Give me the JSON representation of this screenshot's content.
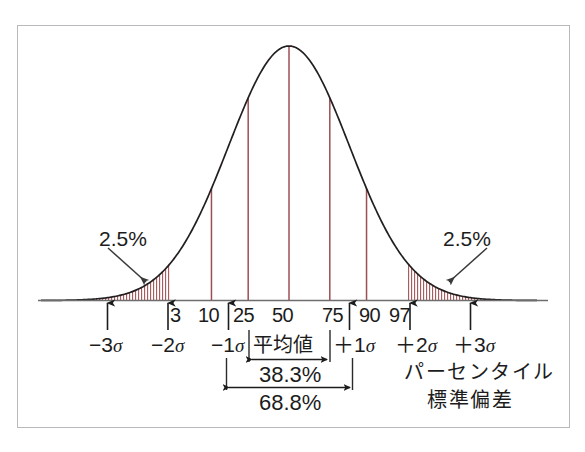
{
  "figure": {
    "kind": "normal-distribution-percentile-diagram",
    "background_color": "#ffffff",
    "frame_color": "#b9b9bd",
    "curve_color": "#231f20",
    "gridline_color": "#9c4f52",
    "hatch_color": "#a35457"
  },
  "chart_data": {
    "type": "line",
    "title": "",
    "subtitle": "",
    "xlabel": "",
    "ylabel": "",
    "grid": false,
    "legend_position": "bottom-right",
    "distribution": "normal",
    "mean": 0,
    "sd": 1,
    "xlim": [
      -4.1,
      4.1
    ],
    "ylim": [
      0,
      1
    ],
    "x": [
      -4.0,
      -3.75,
      -3.5,
      -3.25,
      -3.0,
      -2.75,
      -2.5,
      -2.25,
      -2.0,
      -1.75,
      -1.5,
      -1.25,
      -1.0,
      -0.75,
      -0.5,
      -0.25,
      0.0,
      0.25,
      0.5,
      0.75,
      1.0,
      1.25,
      1.5,
      1.75,
      2.0,
      2.25,
      2.5,
      2.75,
      3.0,
      3.25,
      3.5,
      3.75,
      4.0
    ],
    "y": [
      0.0003,
      0.0009,
      0.0022,
      0.0051,
      0.0111,
      0.0228,
      0.0439,
      0.0796,
      0.1353,
      0.2163,
      0.3247,
      0.4578,
      0.6065,
      0.7548,
      0.8825,
      0.9692,
      1.0,
      0.9692,
      0.8825,
      0.7548,
      0.6065,
      0.4578,
      0.3247,
      0.2163,
      0.1353,
      0.0796,
      0.0439,
      0.0228,
      0.0111,
      0.0051,
      0.0022,
      0.0009,
      0.0003
    ],
    "percentile_gridlines": [
      {
        "percentile": 10,
        "z": -1.2816
      },
      {
        "percentile": 25,
        "z": -0.6745
      },
      {
        "percentile": 50,
        "z": 0.0
      },
      {
        "percentile": 75,
        "z": 0.6745
      },
      {
        "percentile": 90,
        "z": 1.2816
      }
    ],
    "shaded_tails": [
      {
        "name": "left-tail",
        "from_z": -4.1,
        "to_z": -1.96,
        "area_label": "2.5%"
      },
      {
        "name": "right-tail",
        "from_z": 1.96,
        "to_z": 4.1,
        "area_label": "2.5%"
      }
    ]
  },
  "axis": {
    "percentile_ticks": [
      {
        "id": "p3",
        "label": "3",
        "z": -1.881
      },
      {
        "id": "p10",
        "label": "10",
        "z": -1.2816
      },
      {
        "id": "p25",
        "label": "25",
        "z": -0.6745
      },
      {
        "id": "p50",
        "label": "50",
        "z": 0.0
      },
      {
        "id": "p75",
        "label": "75",
        "z": 0.6745
      },
      {
        "id": "p90",
        "label": "90",
        "z": 1.2816
      },
      {
        "id": "p97",
        "label": "97",
        "z": 1.881
      }
    ],
    "sigma_markers": [
      {
        "id": "minus3sigma",
        "sign": "−",
        "num": "3",
        "sigma": "σ",
        "z": -3
      },
      {
        "id": "minus2sigma",
        "sign": "−",
        "num": "2",
        "sigma": "σ",
        "z": -2
      },
      {
        "id": "minus1sigma",
        "sign": "−",
        "num": "1",
        "sigma": "σ",
        "z": -1
      },
      {
        "id": "plus1sigma",
        "sign": "＋",
        "num": "1",
        "sigma": "σ",
        "z": 1
      },
      {
        "id": "plus2sigma",
        "sign": "＋",
        "num": "2",
        "sigma": "σ",
        "z": 2
      },
      {
        "id": "plus3sigma",
        "sign": "＋",
        "num": "3",
        "sigma": "σ",
        "z": 3
      }
    ]
  },
  "annotations": {
    "left_tail_percent": "2.5%",
    "right_tail_percent": "2.5%",
    "mean_label": "平均値",
    "inner_span_percent": "38.3%",
    "outer_span_percent": "68.8%"
  },
  "legend": {
    "percentile_text": "パーセンタイル",
    "sd_text": "標準偏差"
  }
}
